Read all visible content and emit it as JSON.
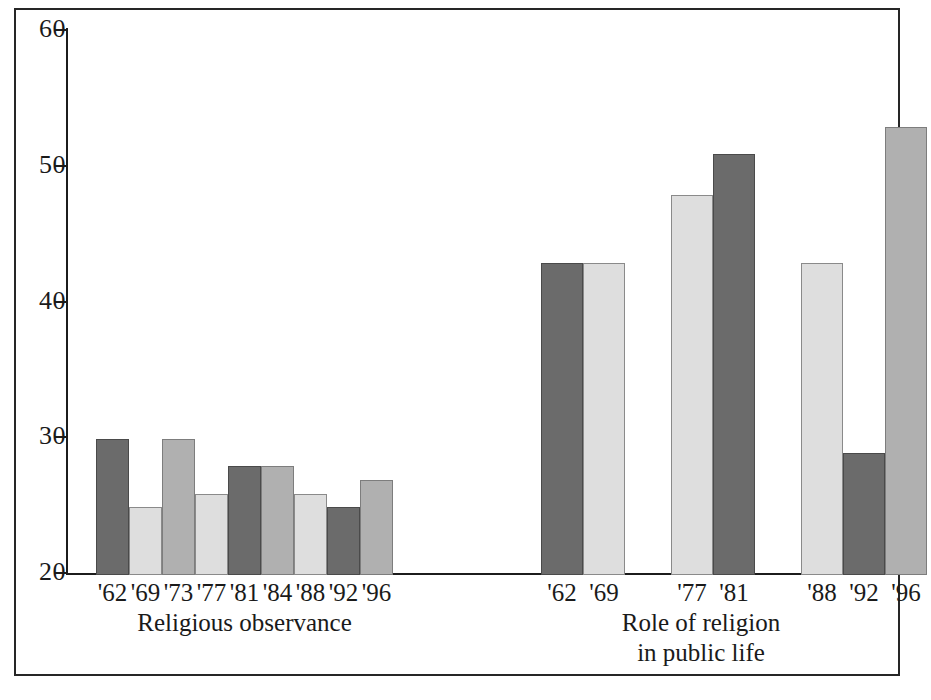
{
  "chart_data": {
    "type": "bar",
    "title": "",
    "subtitle": "",
    "xlabel": "",
    "ylabel": "",
    "ylim": [
      20,
      60
    ],
    "y_ticks": [
      20,
      30,
      40,
      50,
      60
    ],
    "y_tick_labels": [
      "20",
      "30",
      "40",
      "50",
      "60"
    ],
    "grid": false,
    "legend": null,
    "groups": [
      {
        "caption": "Religious observance",
        "caption_lines": [
          "Religious observance"
        ],
        "categories": [
          "'62",
          "'69",
          "'73",
          "'77",
          "'81",
          "'84",
          "'88",
          "'92",
          "'96"
        ],
        "values": [
          30,
          25,
          30,
          26,
          28,
          28,
          26,
          25,
          27
        ],
        "shades": [
          "dark",
          "light",
          "medium",
          "light",
          "dark",
          "medium",
          "light",
          "dark",
          "medium"
        ],
        "clusters": [
          [
            "'62",
            "'69",
            "'73",
            "'77",
            "'81",
            "'84",
            "'88",
            "'92",
            "'96"
          ]
        ]
      },
      {
        "caption": "Role of religion in public life",
        "caption_lines": [
          "Role of religion",
          "in public life"
        ],
        "categories": [
          "'62",
          "'69",
          "'77",
          "'81",
          "'88",
          "'92",
          "'96"
        ],
        "values": [
          43,
          43,
          48,
          51,
          43,
          29,
          53
        ],
        "shades": [
          "dark",
          "light",
          "light",
          "dark",
          "light",
          "dark",
          "medium"
        ],
        "clusters": [
          [
            "'62",
            "'69"
          ],
          [
            "'77",
            "'81"
          ],
          [
            "'88",
            "'92",
            "'96"
          ]
        ]
      }
    ],
    "colors": {
      "dark": "#6b6b6b",
      "medium": "#b0b0b0",
      "light": "#dedede",
      "axis": "#1c1c1c",
      "frame": "#262626",
      "background": "#ffffff",
      "text": "#1a1a1a"
    }
  }
}
